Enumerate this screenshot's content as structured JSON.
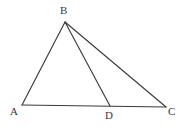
{
  "figure": {
    "type": "geometry-diagram",
    "background_color": "#ffffff",
    "line_color": "#3a3a3a",
    "label_color": "#3a3a3a",
    "canvas": {
      "width": 183,
      "height": 127
    },
    "points": [
      {
        "id": "A",
        "label": "A",
        "x": 22,
        "y": 105,
        "label_x": 10,
        "label_y": 106
      },
      {
        "id": "B",
        "label": "B",
        "x": 65,
        "y": 22,
        "label_x": 60,
        "label_y": 5
      },
      {
        "id": "C",
        "label": "C",
        "x": 166,
        "y": 107,
        "label_x": 168,
        "label_y": 106
      },
      {
        "id": "D",
        "label": "D",
        "x": 110,
        "y": 106,
        "label_x": 105,
        "label_y": 110
      }
    ],
    "segments": [
      {
        "id": "AB",
        "from": "A",
        "to": "B",
        "x1": 22,
        "y1": 105,
        "x2": 65,
        "y2": 22
      },
      {
        "id": "AC",
        "from": "A",
        "to": "C",
        "x1": 22,
        "y1": 105,
        "x2": 166,
        "y2": 107
      },
      {
        "id": "BD",
        "from": "B",
        "to": "D",
        "x1": 65,
        "y1": 22,
        "x2": 110,
        "y2": 106
      },
      {
        "id": "BC",
        "from": "B",
        "to": "C",
        "x1": 65,
        "y1": 22,
        "x2": 166,
        "y2": 107
      }
    ]
  }
}
